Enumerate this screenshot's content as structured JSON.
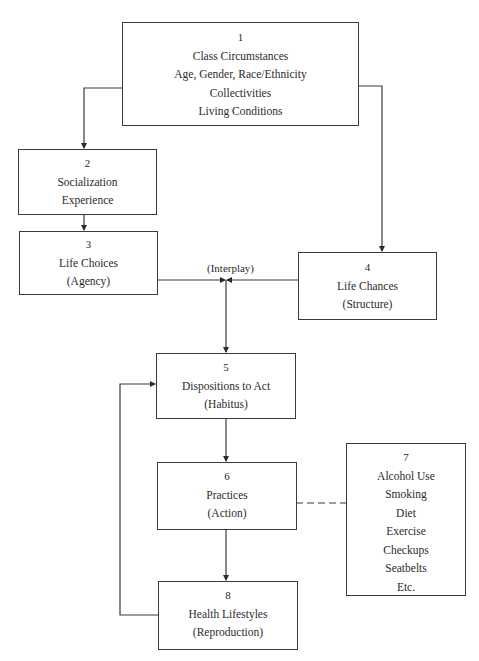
{
  "diagram": {
    "boxes": [
      {
        "id": "1",
        "lines": [
          "1",
          "Class Circumstances",
          "Age, Gender, Race/Ethnicity",
          "Collectivities",
          "Living Conditions"
        ]
      },
      {
        "id": "2",
        "lines": [
          "2",
          "Socialization",
          "Experience"
        ]
      },
      {
        "id": "3",
        "lines": [
          "3",
          "Life Choices",
          "(Agency)"
        ]
      },
      {
        "id": "4",
        "lines": [
          "4",
          "Life Chances",
          "(Structure)"
        ]
      },
      {
        "id": "5",
        "lines": [
          "5",
          "Dispositions to Act",
          "(Habitus)"
        ]
      },
      {
        "id": "6",
        "lines": [
          "6",
          "Practices",
          "(Action)"
        ]
      },
      {
        "id": "7",
        "lines": [
          "7",
          "Alcohol Use",
          "Smoking",
          "Diet",
          "Exercise",
          "Checkups",
          "Seatbelts",
          "Etc."
        ]
      },
      {
        "id": "8",
        "lines": [
          "8",
          "Health Lifestyles",
          "(Reproduction)"
        ]
      }
    ],
    "interplay_label": "(Interplay)",
    "edges": [
      {
        "from": "1",
        "to": "2",
        "style": "solid-arrow"
      },
      {
        "from": "1",
        "to": "4",
        "style": "solid-arrow"
      },
      {
        "from": "2",
        "to": "3",
        "style": "solid-arrow"
      },
      {
        "from": "3",
        "to": "interplay",
        "style": "solid-arrow"
      },
      {
        "from": "4",
        "to": "interplay",
        "style": "solid-arrow"
      },
      {
        "from": "interplay",
        "to": "5",
        "style": "solid-arrow"
      },
      {
        "from": "5",
        "to": "6",
        "style": "solid-arrow"
      },
      {
        "from": "6",
        "to": "8",
        "style": "solid-arrow"
      },
      {
        "from": "8",
        "to": "5",
        "style": "solid-arrow"
      },
      {
        "from": "6",
        "to": "7",
        "style": "dashed"
      }
    ]
  }
}
